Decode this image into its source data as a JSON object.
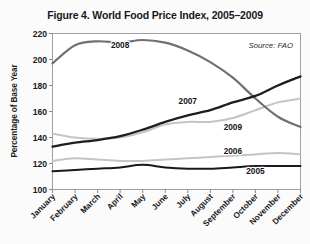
{
  "figure": {
    "title": "Figure 4. World Food Price Index, 2005–2009",
    "source_note": "Source: FAO"
  },
  "chart_data": {
    "type": "line",
    "title": "Figure 4. World Food Price Index, 2005–2009",
    "subtitle": "",
    "xlabel": "",
    "ylabel": "Percentage of Base Year",
    "annotations": [
      "Source: FAO"
    ],
    "legend_position": "inline-labels",
    "grid": false,
    "ylim": [
      100,
      220
    ],
    "yticks": [
      100,
      120,
      140,
      160,
      180,
      200,
      220
    ],
    "ytick_labels": [
      "100",
      "120",
      "140",
      "160",
      "180",
      "200",
      "220"
    ],
    "categories": [
      "January",
      "February",
      "March",
      "April",
      "May",
      "June",
      "July",
      "August",
      "September",
      "October",
      "November",
      "December"
    ],
    "series": [
      {
        "name": "2005",
        "label": "2005",
        "color": "#18191b",
        "width": 2.0,
        "values": [
          114,
          115,
          116,
          117,
          119,
          117,
          116,
          116,
          117,
          118,
          118,
          118
        ]
      },
      {
        "name": "2006",
        "label": "2006",
        "color": "#c3c5c7",
        "width": 2.0,
        "values": [
          122,
          124,
          123,
          122,
          122,
          123,
          124,
          125,
          126,
          127,
          128,
          127
        ]
      },
      {
        "name": "2007",
        "label": "2007",
        "color": "#1d1e20",
        "width": 2.3,
        "values": [
          133,
          136,
          138,
          141,
          146,
          152,
          157,
          161,
          167,
          172,
          180,
          187
        ]
      },
      {
        "name": "2008",
        "label": "2008",
        "color": "#6e7073",
        "width": 2.2,
        "values": [
          197,
          211,
          214,
          213,
          215,
          213,
          207,
          198,
          186,
          170,
          156,
          148
        ]
      },
      {
        "name": "2009",
        "label": "2009",
        "color": "#c3c5c7",
        "width": 2.0,
        "values": [
          143,
          140,
          139,
          140,
          144,
          150,
          152,
          152,
          155,
          161,
          167,
          170
        ]
      }
    ],
    "series_label_positions": [
      {
        "series": "2005",
        "x_category": "October",
        "y_value": 112
      },
      {
        "series": "2006",
        "x_category": "September",
        "y_value": 127
      },
      {
        "series": "2007",
        "x_category": "July",
        "y_value": 166
      },
      {
        "series": "2008",
        "x_category": "April",
        "y_value": 209
      },
      {
        "series": "2009",
        "x_category": "September",
        "y_value": 146
      }
    ]
  }
}
